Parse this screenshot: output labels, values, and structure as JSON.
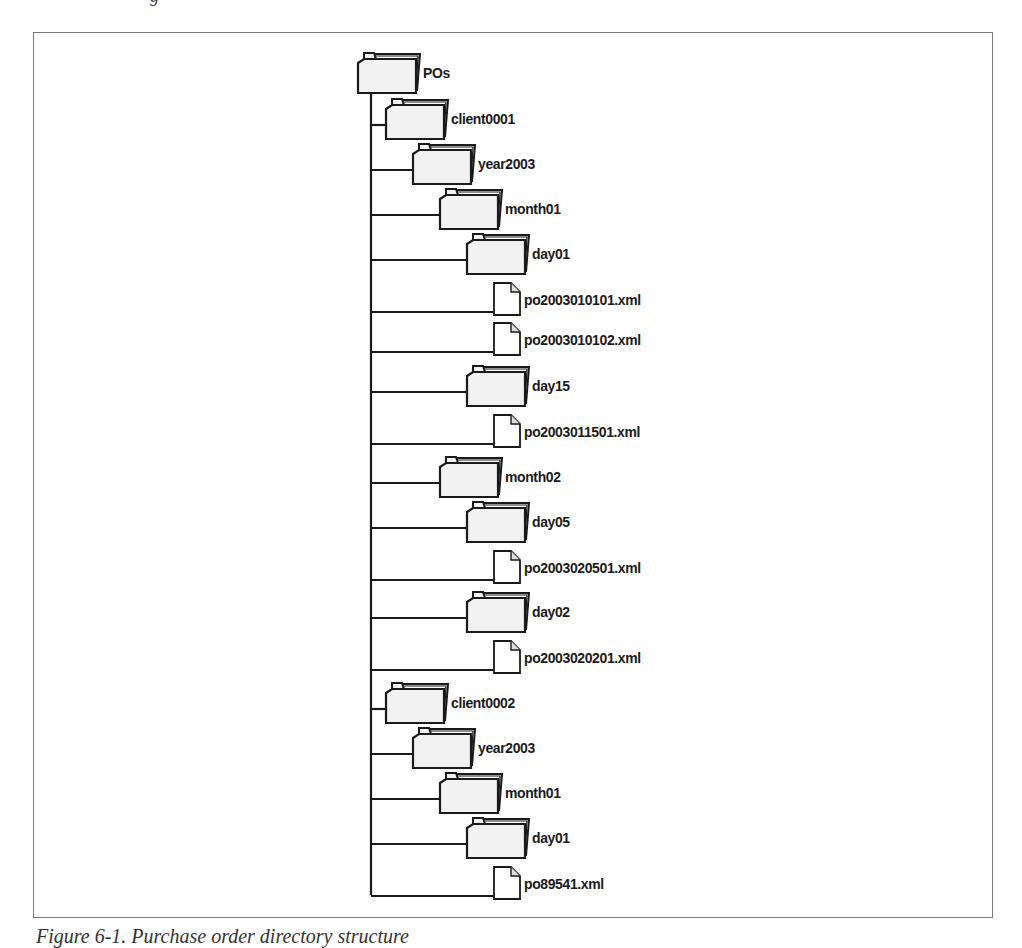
{
  "figure": {
    "top_cutoff_text": "g",
    "caption": "Figure 6-1. Purchase order directory structure"
  },
  "tree": {
    "nodes": [
      {
        "type": "folder",
        "label": "POs",
        "depth": 0
      },
      {
        "type": "folder",
        "label": "client0001",
        "depth": 1
      },
      {
        "type": "folder",
        "label": "year2003",
        "depth": 2
      },
      {
        "type": "folder",
        "label": "month01",
        "depth": 3
      },
      {
        "type": "folder",
        "label": "day01",
        "depth": 4
      },
      {
        "type": "file",
        "label": "po2003010101.xml",
        "depth": 5
      },
      {
        "type": "file",
        "label": "po2003010102.xml",
        "depth": 5
      },
      {
        "type": "folder",
        "label": "day15",
        "depth": 4
      },
      {
        "type": "file",
        "label": "po2003011501.xml",
        "depth": 5
      },
      {
        "type": "folder",
        "label": "month02",
        "depth": 3
      },
      {
        "type": "folder",
        "label": "day05",
        "depth": 4
      },
      {
        "type": "file",
        "label": "po2003020501.xml",
        "depth": 5
      },
      {
        "type": "folder",
        "label": "day02",
        "depth": 4
      },
      {
        "type": "file",
        "label": "po2003020201.xml",
        "depth": 5
      },
      {
        "type": "folder",
        "label": "client0002",
        "depth": 1
      },
      {
        "type": "folder",
        "label": "year2003",
        "depth": 2
      },
      {
        "type": "folder",
        "label": "month01",
        "depth": 3
      },
      {
        "type": "folder",
        "label": "day01",
        "depth": 4
      },
      {
        "type": "file",
        "label": "po89541.xml",
        "depth": 5
      }
    ]
  },
  "colors": {
    "line": "#1a1a1a",
    "folder_fill": "#f2f2f2",
    "file_fill": "#ffffff",
    "frame": "#7a7a7a"
  }
}
